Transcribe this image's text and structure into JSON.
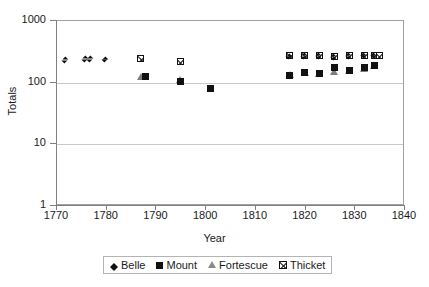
{
  "chart_data": {
    "type": "scatter",
    "title": "",
    "xlabel": "Year",
    "ylabel": "Totals",
    "xlim": [
      1770,
      1840
    ],
    "ylim": [
      1,
      1000
    ],
    "yscale": "log",
    "grid": true,
    "legend_position": "bottom",
    "xticks": [
      "1770",
      "1780",
      "1790",
      "1800",
      "1810",
      "1820",
      "1830",
      "1840"
    ],
    "xtick_values": [
      1770,
      1780,
      1790,
      1800,
      1810,
      1820,
      1830,
      1840
    ],
    "yticks": [
      "1000",
      "100",
      "10",
      "1"
    ],
    "ytick_values": [
      1000,
      100,
      10,
      1
    ],
    "series": [
      {
        "name": "Belle",
        "marker": "diamond",
        "color": "#111111",
        "points": [
          {
            "x": 1772,
            "y": 225
          },
          {
            "x": 1776,
            "y": 232
          },
          {
            "x": 1777,
            "y": 232
          },
          {
            "x": 1780,
            "y": 228
          },
          {
            "x": 1817,
            "y": 255
          },
          {
            "x": 1820,
            "y": 258
          },
          {
            "x": 1823,
            "y": 258
          },
          {
            "x": 1826,
            "y": 252
          },
          {
            "x": 1829,
            "y": 258
          },
          {
            "x": 1832,
            "y": 262
          },
          {
            "x": 1834,
            "y": 262
          }
        ]
      },
      {
        "name": "Mount",
        "marker": "square",
        "color": "#111111",
        "points": [
          {
            "x": 1788,
            "y": 122
          },
          {
            "x": 1795,
            "y": 99
          },
          {
            "x": 1801,
            "y": 78
          },
          {
            "x": 1817,
            "y": 128
          },
          {
            "x": 1820,
            "y": 140
          },
          {
            "x": 1823,
            "y": 138
          },
          {
            "x": 1826,
            "y": 172
          },
          {
            "x": 1829,
            "y": 152
          },
          {
            "x": 1832,
            "y": 168
          },
          {
            "x": 1834,
            "y": 182
          }
        ]
      },
      {
        "name": "Fortescue",
        "marker": "triangle",
        "color": "#7d7d7d",
        "points": [
          {
            "x": 1787,
            "y": 118
          },
          {
            "x": 1795,
            "y": 108
          },
          {
            "x": 1817,
            "y": 126
          },
          {
            "x": 1820,
            "y": 136
          },
          {
            "x": 1823,
            "y": 134
          },
          {
            "x": 1826,
            "y": 142
          },
          {
            "x": 1829,
            "y": 150
          },
          {
            "x": 1832,
            "y": 160
          },
          {
            "x": 1834,
            "y": 178
          }
        ]
      },
      {
        "name": "Thicket",
        "marker": "crossed-square",
        "color": "#111111",
        "points": [
          {
            "x": 1787,
            "y": 240
          },
          {
            "x": 1795,
            "y": 215
          },
          {
            "x": 1817,
            "y": 265
          },
          {
            "x": 1820,
            "y": 262
          },
          {
            "x": 1823,
            "y": 265
          },
          {
            "x": 1826,
            "y": 258
          },
          {
            "x": 1829,
            "y": 262
          },
          {
            "x": 1832,
            "y": 268
          },
          {
            "x": 1834,
            "y": 268
          },
          {
            "x": 1835,
            "y": 265
          }
        ]
      }
    ]
  },
  "legend": {
    "entries": [
      {
        "label": "Belle"
      },
      {
        "label": "Mount"
      },
      {
        "label": "Fortescue"
      },
      {
        "label": "Thicket"
      }
    ]
  }
}
